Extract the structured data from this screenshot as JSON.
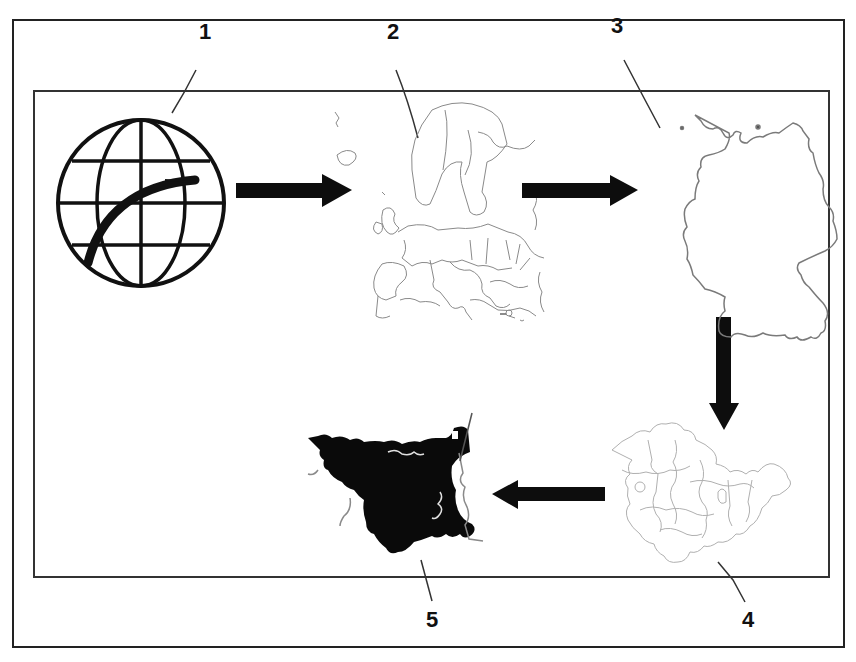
{
  "diagram": {
    "type": "flow",
    "colors": {
      "ink": "#111111",
      "map_line": "#8a8a8a",
      "arrow": "#0d0d0d",
      "frame": "#222222"
    },
    "nodes": [
      {
        "id": 1,
        "label": "1",
        "depicts": "globe-icon"
      },
      {
        "id": 2,
        "label": "2",
        "depicts": "europe-map"
      },
      {
        "id": 3,
        "label": "3",
        "depicts": "germany-map"
      },
      {
        "id": 4,
        "label": "4",
        "depicts": "district-map"
      },
      {
        "id": 5,
        "label": "5",
        "depicts": "local-region-filled-map"
      }
    ],
    "edges": [
      {
        "from": 1,
        "to": 2,
        "direction": "right"
      },
      {
        "from": 2,
        "to": 3,
        "direction": "right"
      },
      {
        "from": 3,
        "to": 4,
        "direction": "down"
      },
      {
        "from": 4,
        "to": 5,
        "direction": "left"
      }
    ]
  }
}
